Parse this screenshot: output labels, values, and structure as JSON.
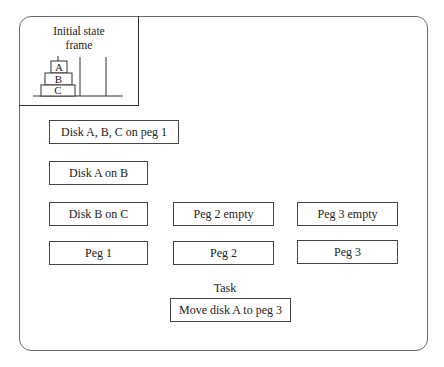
{
  "frame": {
    "title_line1": "Initial state",
    "title_line2": "frame",
    "disks": [
      "A",
      "B",
      "C"
    ]
  },
  "boxes": {
    "disks_on_peg1": "Disk A, B, C on peg 1",
    "disk_a_on_b": "Disk A on B",
    "disk_b_on_c": "Disk B on C",
    "peg2_empty": "Peg 2 empty",
    "peg3_empty": "Peg 3 empty",
    "peg1": "Peg 1",
    "peg2": "Peg 2",
    "peg3": "Peg 3"
  },
  "task": {
    "label": "Task",
    "value": "Move disk A to peg 3"
  }
}
